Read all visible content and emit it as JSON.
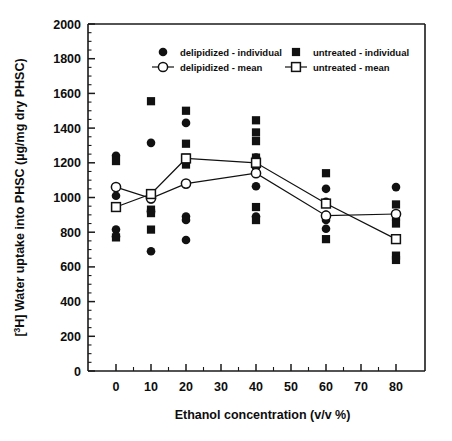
{
  "chart_data": {
    "type": "scatter",
    "title": "",
    "xlabel": "Ethanol concentration (v/v %)",
    "ylabel": "[3H] Water uptake into PHSC (µg/mg dry PHSC)",
    "ylabel_prefix": "[",
    "ylabel_sup": "3",
    "ylabel_rest": "H] Water uptake into PHSC (µg/mg dry PHSC)",
    "xlim": [
      -5,
      88
    ],
    "ylim": [
      0,
      2000
    ],
    "x_ticks": [
      0,
      10,
      20,
      30,
      40,
      50,
      60,
      70,
      80
    ],
    "x_tick_labels": [
      "0",
      "10",
      "20",
      "30",
      "40",
      "50",
      "60",
      "70",
      "80"
    ],
    "x_minor_step": 5,
    "y_ticks": [
      0,
      200,
      400,
      600,
      800,
      1000,
      1200,
      1400,
      1600,
      1800,
      2000
    ],
    "y_tick_labels": [
      "0",
      "200",
      "400",
      "600",
      "800",
      "1000",
      "1200",
      "1400",
      "1600",
      "1800",
      "2000"
    ],
    "y_minor_step": 50,
    "grid": false,
    "legend_position": "top-inside",
    "categories": [
      0,
      10,
      20,
      40,
      60,
      80
    ],
    "series": [
      {
        "name": "delipidized - individual",
        "marker": "filled-circle",
        "color": "#111111",
        "points": [
          {
            "x": 0,
            "y": 1240
          },
          {
            "x": 0,
            "y": 1060
          },
          {
            "x": 0,
            "y": 1010
          },
          {
            "x": 0,
            "y": 815
          },
          {
            "x": 0,
            "y": 775
          },
          {
            "x": 10,
            "y": 1315
          },
          {
            "x": 10,
            "y": 990
          },
          {
            "x": 10,
            "y": 920
          },
          {
            "x": 10,
            "y": 690
          },
          {
            "x": 20,
            "y": 1430
          },
          {
            "x": 20,
            "y": 1080
          },
          {
            "x": 20,
            "y": 890
          },
          {
            "x": 20,
            "y": 870
          },
          {
            "x": 20,
            "y": 755
          },
          {
            "x": 40,
            "y": 1230
          },
          {
            "x": 40,
            "y": 1175
          },
          {
            "x": 40,
            "y": 1065
          },
          {
            "x": 40,
            "y": 890
          },
          {
            "x": 60,
            "y": 1050
          },
          {
            "x": 60,
            "y": 975
          },
          {
            "x": 60,
            "y": 900
          },
          {
            "x": 60,
            "y": 870
          },
          {
            "x": 60,
            "y": 820
          },
          {
            "x": 80,
            "y": 1060
          },
          {
            "x": 80,
            "y": 905
          }
        ]
      },
      {
        "name": "untreated - individual",
        "marker": "filled-square",
        "color": "#111111",
        "points": [
          {
            "x": 0,
            "y": 1210
          },
          {
            "x": 0,
            "y": 950
          },
          {
            "x": 0,
            "y": 770
          },
          {
            "x": 10,
            "y": 1555
          },
          {
            "x": 10,
            "y": 1020
          },
          {
            "x": 10,
            "y": 930
          },
          {
            "x": 10,
            "y": 910
          },
          {
            "x": 10,
            "y": 815
          },
          {
            "x": 20,
            "y": 1500
          },
          {
            "x": 20,
            "y": 1310
          },
          {
            "x": 20,
            "y": 1230
          },
          {
            "x": 20,
            "y": 1190
          },
          {
            "x": 40,
            "y": 1445
          },
          {
            "x": 40,
            "y": 1375
          },
          {
            "x": 40,
            "y": 1325
          },
          {
            "x": 40,
            "y": 1230
          },
          {
            "x": 40,
            "y": 1190
          },
          {
            "x": 40,
            "y": 945
          },
          {
            "x": 40,
            "y": 870
          },
          {
            "x": 60,
            "y": 1140
          },
          {
            "x": 60,
            "y": 760
          },
          {
            "x": 80,
            "y": 960
          },
          {
            "x": 80,
            "y": 890
          },
          {
            "x": 80,
            "y": 850
          },
          {
            "x": 80,
            "y": 665
          },
          {
            "x": 80,
            "y": 640
          }
        ]
      },
      {
        "name": "delipidized - mean",
        "marker": "open-circle",
        "color": "#111111",
        "values": [
          1060,
          995,
          1080,
          1140,
          895,
          905
        ]
      },
      {
        "name": "untreated - mean",
        "marker": "open-square",
        "color": "#111111",
        "values": [
          945,
          1020,
          1225,
          1200,
          965,
          760
        ]
      }
    ]
  },
  "legend": {
    "entries": [
      {
        "label": "delipidized - individual",
        "marker": "filled-circle"
      },
      {
        "label": "untreated - individual",
        "marker": "filled-square"
      },
      {
        "label": "delipidized - mean",
        "marker": "open-circle-line"
      },
      {
        "label": "untreated - mean",
        "marker": "open-square-line"
      }
    ]
  }
}
